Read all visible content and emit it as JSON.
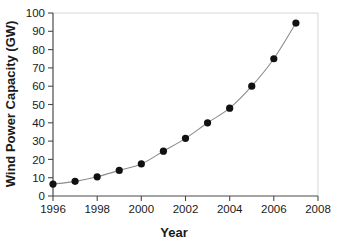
{
  "chart_data": {
    "type": "line",
    "title": "",
    "xlabel": "Year",
    "ylabel": "Wind Power Capacity (GW)",
    "x": [
      1996,
      1997,
      1998,
      1999,
      2000,
      2001,
      2002,
      2003,
      2004,
      2005,
      2006,
      2007
    ],
    "values": [
      6.5,
      8.0,
      10.5,
      14.0,
      17.5,
      24.5,
      31.5,
      40.0,
      48.0,
      60.0,
      75.0,
      94.5
    ],
    "series": [
      {
        "name": "Wind Power Capacity",
        "values": [
          6.5,
          8.0,
          10.5,
          14.0,
          17.5,
          24.5,
          31.5,
          40.0,
          48.0,
          60.0,
          75.0,
          94.5
        ]
      }
    ],
    "xlim": [
      1996,
      2008
    ],
    "ylim": [
      0,
      100
    ],
    "xticks": [
      1996,
      1998,
      2000,
      2002,
      2004,
      2006,
      2008
    ],
    "xticklabels": [
      "1996",
      "1998",
      "2000",
      "2002",
      "2004",
      "2006",
      "2008"
    ],
    "yticks": [
      0,
      10,
      20,
      30,
      40,
      50,
      60,
      70,
      80,
      90,
      100
    ],
    "yticklabels": [
      "0",
      "10",
      "20",
      "30",
      "40",
      "50",
      "60",
      "70",
      "80",
      "90",
      "100"
    ],
    "grid": false,
    "legend": null,
    "marker": "filled-circle",
    "marker_color": "#111111",
    "line_color": "#8c8c8c",
    "background_color": "#ffffff"
  }
}
